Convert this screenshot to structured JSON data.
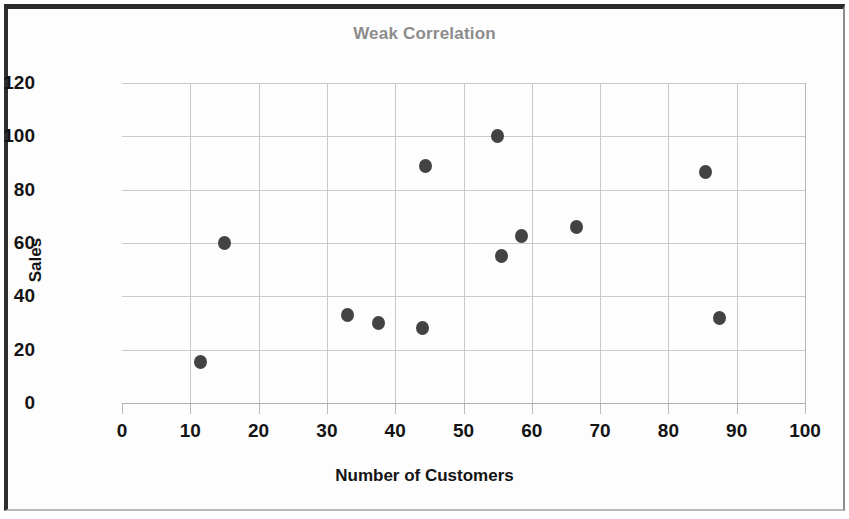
{
  "chart_data": {
    "type": "scatter",
    "title": "Weak Correlation",
    "xlabel": "Number of Customers",
    "ylabel": "Sales",
    "xlim": [
      0,
      100
    ],
    "ylim": [
      0,
      120
    ],
    "x_ticks": [
      0,
      10,
      20,
      30,
      40,
      50,
      60,
      70,
      80,
      90,
      100
    ],
    "y_ticks": [
      0,
      20,
      40,
      60,
      80,
      100,
      120
    ],
    "x_tick_labels": [
      "0",
      "10",
      "20",
      "30",
      "40",
      "50",
      "60",
      "70",
      "80",
      "90",
      "100"
    ],
    "y_tick_labels": [
      "0",
      "20",
      "40",
      "60",
      "80",
      "100",
      "120"
    ],
    "grid": true,
    "legend": false,
    "marker_color": "#434343",
    "title_color": "#8c8c8c",
    "grid_color": "#c9c9c9",
    "points": [
      {
        "x": 11.5,
        "y": 15.5
      },
      {
        "x": 15.0,
        "y": 60.0
      },
      {
        "x": 33.0,
        "y": 33.0
      },
      {
        "x": 37.5,
        "y": 30.0
      },
      {
        "x": 44.0,
        "y": 28.0
      },
      {
        "x": 44.5,
        "y": 89.0
      },
      {
        "x": 55.0,
        "y": 100.0
      },
      {
        "x": 55.5,
        "y": 55.0
      },
      {
        "x": 58.5,
        "y": 62.5
      },
      {
        "x": 66.5,
        "y": 66.0
      },
      {
        "x": 85.5,
        "y": 86.5
      },
      {
        "x": 87.5,
        "y": 32.0
      }
    ]
  }
}
